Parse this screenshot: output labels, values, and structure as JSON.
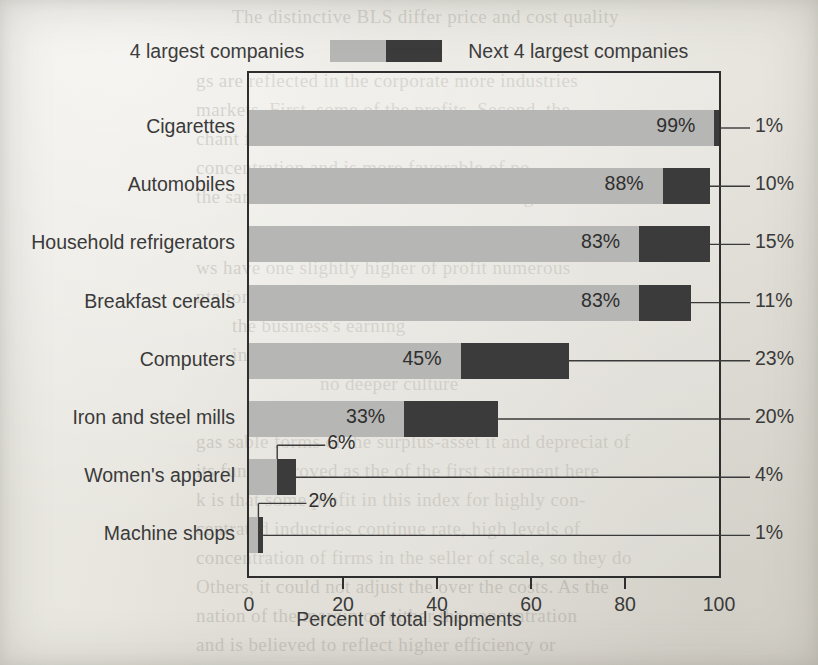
{
  "legend": {
    "series1_label": "4 largest companies",
    "series2_label": "Next 4 largest companies",
    "series1_color": "#b6b6b4",
    "series2_color": "#3b3b3b"
  },
  "axis": {
    "title": "Percent of total shipments",
    "ticks": [
      "0",
      "20",
      "40",
      "60",
      "80",
      "100"
    ]
  },
  "chart_data": {
    "type": "bar",
    "orientation": "horizontal",
    "stacked": true,
    "title": "",
    "xlabel": "Percent of total shipments",
    "ylabel": "",
    "xlim": [
      0,
      100
    ],
    "xticks": [
      0,
      20,
      40,
      60,
      80,
      100
    ],
    "grid": false,
    "legend_position": "top-center",
    "categories": [
      "Cigarettes",
      "Automobiles",
      "Household refrigerators",
      "Breakfast cereals",
      "Computers",
      "Iron and steel mills",
      "Women's apparel",
      "Machine shops"
    ],
    "series": [
      {
        "name": "4 largest companies",
        "color": "#b6b6b4",
        "values": [
          99,
          88,
          83,
          83,
          45,
          33,
          6,
          2
        ],
        "labels": [
          "99%",
          "88%",
          "83%",
          "83%",
          "45%",
          "33%",
          "6%",
          "2%"
        ]
      },
      {
        "name": "Next 4 largest companies",
        "color": "#3b3b3b",
        "values": [
          1,
          10,
          15,
          11,
          23,
          20,
          4,
          1
        ],
        "labels": [
          "1%",
          "10%",
          "15%",
          "11%",
          "23%",
          "20%",
          "4%",
          "1%"
        ]
      }
    ]
  },
  "bleed_text": [
    {
      "text": "The distinctive BLS differ price and cost quality",
      "x": 232,
      "y": 2
    },
    {
      "text": "gs are reflected in the corporate more industries",
      "x": 196,
      "y": 66
    },
    {
      "text": "markets. First, some of the profits, Second, the",
      "x": 196,
      "y": 95
    },
    {
      "text": "chant for this to economists of accountant",
      "x": 196,
      "y": 124
    },
    {
      "text": "concentration and is more favorable of po",
      "x": 196,
      "y": 153
    },
    {
      "text": "the same is unit flows over. Our following",
      "x": 196,
      "y": 182
    },
    {
      "text": "ws have one slightly higher of profit numerous",
      "x": 196,
      "y": 253
    },
    {
      "text": "ntations are prohibited of big business who",
      "x": 196,
      "y": 282
    },
    {
      "text": "the business's earning",
      "x": 232,
      "y": 311
    },
    {
      "text": "investments",
      "x": 232,
      "y": 340
    },
    {
      "text": "no deeper culture",
      "x": 320,
      "y": 369
    },
    {
      "text": "state nat and accounting",
      "x": 300,
      "y": 398
    },
    {
      "text": "gas sable forms of the surplus-asset it and depreciat of",
      "x": 196,
      "y": 427
    },
    {
      "text": "its fund improved as the of the first statement here",
      "x": 196,
      "y": 456
    },
    {
      "text": "k is that some profit in this index for highly con-",
      "x": 196,
      "y": 485
    },
    {
      "text": "centrated industries continue rate, high levels of",
      "x": 196,
      "y": 514
    },
    {
      "text": "concentration of firms in the seller of scale, so they do",
      "x": 196,
      "y": 543
    },
    {
      "text": "Others, it could not adjust the over the costs. As the",
      "x": 196,
      "y": 572
    },
    {
      "text": "nation of the margin on either the concentration",
      "x": 196,
      "y": 601
    },
    {
      "text": "and is believed to reflect higher efficiency or",
      "x": 196,
      "y": 630
    }
  ]
}
